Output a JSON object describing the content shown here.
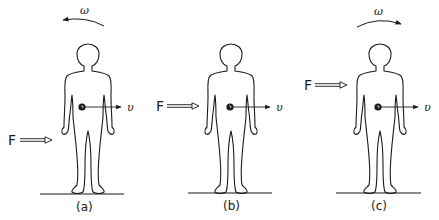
{
  "figure": {
    "panels": [
      {
        "id": "a",
        "caption": "(a)",
        "force_label": "F",
        "velocity_label": "υ",
        "angular_label": "ω",
        "angular_direction": "counterclockwise (arrow points left)",
        "force_height": "below center of mass (near knees)"
      },
      {
        "id": "b",
        "caption": "(b)",
        "force_label": "F",
        "velocity_label": "υ",
        "angular_label": "",
        "angular_direction": "none",
        "force_height": "at center of mass"
      },
      {
        "id": "c",
        "caption": "(c)",
        "force_label": "F",
        "velocity_label": "υ",
        "angular_label": "ω",
        "angular_direction": "clockwise (arrow points right)",
        "force_height": "above center of mass (chest)"
      }
    ],
    "colors": {
      "line": "#1a1a1a",
      "background": "#ffffff",
      "force_arrow_fill": "#ffffff"
    }
  }
}
